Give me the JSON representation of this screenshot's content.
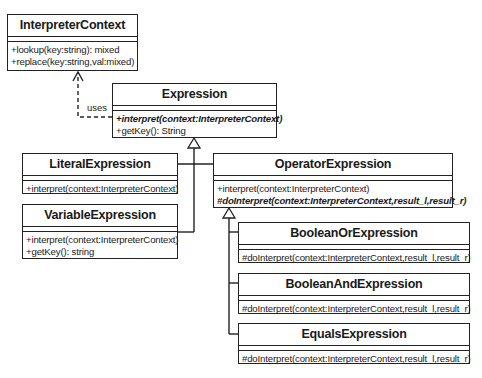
{
  "diagram": {
    "type": "UML class diagram",
    "classes": [
      {
        "id": "interpreter-context",
        "name": "InterpreterContext",
        "methods": [
          {
            "text": "+lookup(key:string): mixed",
            "abstract": false
          },
          {
            "text": "+replace(key:string,val:mixed)",
            "abstract": false
          }
        ]
      },
      {
        "id": "expression",
        "name": "Expression",
        "methods": [
          {
            "text": "+interpret(context:InterpreterContext)",
            "abstract": true
          },
          {
            "text": "+getKey(): String",
            "abstract": false
          }
        ]
      },
      {
        "id": "literal-expression",
        "name": "LiteralExpression",
        "methods": [
          {
            "text": "+interpret(context:InterpreterContext)",
            "abstract": false
          }
        ]
      },
      {
        "id": "variable-expression",
        "name": "VariableExpression",
        "methods": [
          {
            "text": "+interpret(context:InterpreterContext)",
            "abstract": false
          },
          {
            "text": "+getKey(): string",
            "abstract": false
          }
        ]
      },
      {
        "id": "operator-expression",
        "name": "OperatorExpression",
        "methods": [
          {
            "text": "+interpret(context:InterpreterContext)",
            "abstract": false
          },
          {
            "text": "#doInterpret(context:InterpreterContext,result_l,result_r)",
            "abstract": true
          }
        ]
      },
      {
        "id": "boolean-or-expression",
        "name": "BooleanOrExpression",
        "methods": [
          {
            "text": "#doInterpret(context:InterpreterContext,result_l,result_r)",
            "abstract": false
          }
        ]
      },
      {
        "id": "boolean-and-expression",
        "name": "BooleanAndExpression",
        "methods": [
          {
            "text": "#doInterpret(context:InterpreterContext,result_l,result_r)",
            "abstract": false
          }
        ]
      },
      {
        "id": "equals-expression",
        "name": "EqualsExpression",
        "methods": [
          {
            "text": "#doInterpret(context:InterpreterContext,result_l,result_r)",
            "abstract": false
          }
        ]
      }
    ],
    "relationships": [
      {
        "type": "dependency",
        "from": "Expression",
        "to": "InterpreterContext",
        "label": "uses"
      },
      {
        "type": "generalization",
        "from": "LiteralExpression",
        "to": "Expression"
      },
      {
        "type": "generalization",
        "from": "VariableExpression",
        "to": "Expression"
      },
      {
        "type": "generalization",
        "from": "OperatorExpression",
        "to": "Expression"
      },
      {
        "type": "generalization",
        "from": "BooleanOrExpression",
        "to": "OperatorExpression"
      },
      {
        "type": "generalization",
        "from": "BooleanAndExpression",
        "to": "OperatorExpression"
      },
      {
        "type": "generalization",
        "from": "EqualsExpression",
        "to": "OperatorExpression"
      }
    ],
    "labels": {
      "uses": "uses"
    }
  }
}
